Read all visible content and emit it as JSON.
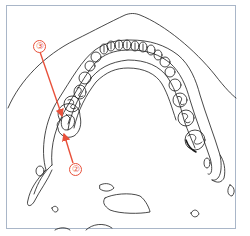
{
  "figure": {
    "line_color": "#1a1a1a",
    "frame_color": "#a9b6c8",
    "accent_color": "#e8503a"
  },
  "callouts": [
    {
      "id": "callout-3",
      "label": "③",
      "number": "3"
    },
    {
      "id": "callout-2",
      "label": "②",
      "number": "2"
    }
  ]
}
